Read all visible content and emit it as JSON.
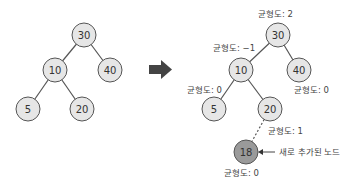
{
  "colors": {
    "node_fill": "#e6e6e6",
    "node_stroke": "#555555",
    "new_node_fill": "#9a9a9a",
    "edge": "#555555",
    "arrow": "#444444",
    "text": "#333333"
  },
  "before_tree": {
    "nodes": [
      {
        "id": "30",
        "label": "30"
      },
      {
        "id": "10",
        "label": "10"
      },
      {
        "id": "40",
        "label": "40"
      },
      {
        "id": "5",
        "label": "5"
      },
      {
        "id": "20",
        "label": "20"
      }
    ]
  },
  "after_tree": {
    "nodes": [
      {
        "id": "30",
        "label": "30",
        "balance": "균형도: 2"
      },
      {
        "id": "10",
        "label": "10",
        "balance": "균형도: −1"
      },
      {
        "id": "40",
        "label": "40",
        "balance": "균형도: 0"
      },
      {
        "id": "5",
        "label": "5",
        "balance": "균형도: 0"
      },
      {
        "id": "20",
        "label": "20",
        "balance": "균형도: 1"
      },
      {
        "id": "18",
        "label": "18",
        "balance": "균형도: 0"
      }
    ],
    "new_node_annotation": "새로 추가된 노드"
  }
}
